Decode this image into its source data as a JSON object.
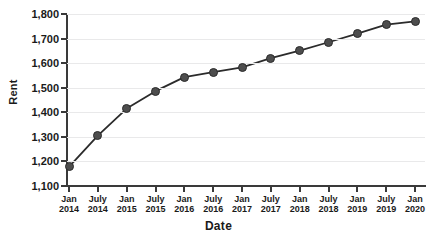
{
  "chart_data": {
    "type": "line",
    "title": "",
    "xlabel": "Date",
    "ylabel": "Rent",
    "categories": [
      "Jan 2014",
      "July 2014",
      "Jan 2015",
      "July 2015",
      "Jan 2016",
      "July 2016",
      "Jan 2017",
      "July 2017",
      "Jan 2018",
      "July 2018",
      "Jan 2019",
      "July 2019",
      "Jan 2020"
    ],
    "x_tick_labels": [
      {
        "line1": "Jan",
        "line2": "2014"
      },
      {
        "line1": "July",
        "line2": "2014"
      },
      {
        "line1": "Jan",
        "line2": "2015"
      },
      {
        "line1": "July",
        "line2": "2015"
      },
      {
        "line1": "Jan",
        "line2": "2016"
      },
      {
        "line1": "July",
        "line2": "2016"
      },
      {
        "line1": "Jan",
        "line2": "2017"
      },
      {
        "line1": "July",
        "line2": "2017"
      },
      {
        "line1": "Jan",
        "line2": "2018"
      },
      {
        "line1": "July",
        "line2": "2018"
      },
      {
        "line1": "Jan",
        "line2": "2019"
      },
      {
        "line1": "July",
        "line2": "2019"
      },
      {
        "line1": "Jan",
        "line2": "2020"
      }
    ],
    "values": [
      1178,
      1305,
      1415,
      1486,
      1543,
      1563,
      1583,
      1620,
      1651,
      1685,
      1720,
      1757,
      1770
    ],
    "ylim": [
      1100,
      1800
    ],
    "y_ticks": [
      1100,
      1200,
      1300,
      1400,
      1500,
      1600,
      1700,
      1800
    ],
    "y_tick_labels": [
      "1,100",
      "1,200",
      "1,300",
      "1,400",
      "1,500",
      "1,600",
      "1,700",
      "1,800"
    ],
    "grid": true,
    "legend": "none",
    "series_color": "#4d4d4d",
    "line_color": "#2b2b2b",
    "grid_color": "#e9e9ea",
    "axis_color": "#3a3a3a"
  }
}
